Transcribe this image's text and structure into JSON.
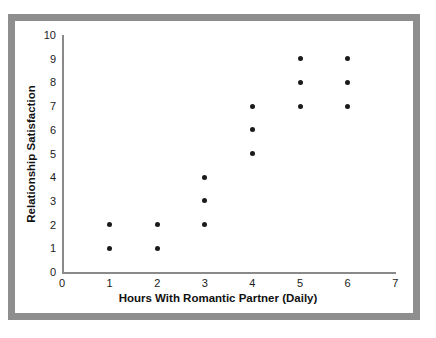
{
  "chart_data": {
    "type": "scatter",
    "title": "",
    "xlabel": "Hours With Romantic Partner (Daily)",
    "ylabel": "Relationship Satisfaction",
    "xlim": [
      0,
      7
    ],
    "ylim": [
      0,
      10
    ],
    "xticks": [
      0,
      1,
      2,
      3,
      4,
      5,
      6,
      7
    ],
    "yticks": [
      0,
      1,
      2,
      3,
      4,
      5,
      6,
      7,
      8,
      9,
      10
    ],
    "xtick_labels": [
      "0",
      "1",
      "2",
      "3",
      "4",
      "5",
      "6",
      "7"
    ],
    "ytick_labels": [
      "0",
      "1",
      "2",
      "3",
      "4",
      "5",
      "6",
      "7",
      "8",
      "9",
      "10"
    ],
    "grid": false,
    "legend": null,
    "marker": "filled-circle",
    "marker_color": "#1a1a1a",
    "points": [
      {
        "x": 1,
        "y": 1
      },
      {
        "x": 1,
        "y": 2
      },
      {
        "x": 2,
        "y": 1
      },
      {
        "x": 2,
        "y": 2
      },
      {
        "x": 3,
        "y": 2
      },
      {
        "x": 3,
        "y": 3
      },
      {
        "x": 3,
        "y": 4
      },
      {
        "x": 4,
        "y": 5
      },
      {
        "x": 4,
        "y": 6
      },
      {
        "x": 4,
        "y": 7
      },
      {
        "x": 5,
        "y": 7
      },
      {
        "x": 5,
        "y": 8
      },
      {
        "x": 5,
        "y": 9
      },
      {
        "x": 6,
        "y": 7
      },
      {
        "x": 6,
        "y": 8
      },
      {
        "x": 6,
        "y": 9
      }
    ]
  },
  "style": {
    "frame_color": "#8e8e8e",
    "axis_color": "#8a8a8a",
    "background": "#ffffff",
    "text_color": "#111111"
  },
  "geometry": {
    "x_origin_px": 62,
    "y_origin_px": 272,
    "x_unit_px": 47.6,
    "y_unit_px": 23.7
  }
}
